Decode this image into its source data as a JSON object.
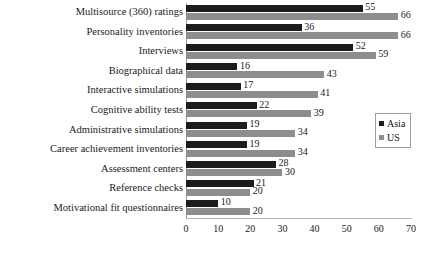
{
  "chart_data": {
    "type": "bar",
    "orientation": "horizontal",
    "title": "",
    "xlabel": "",
    "ylabel": "",
    "xlim": [
      0,
      70
    ],
    "xticks": [
      0,
      10,
      20,
      30,
      40,
      50,
      60,
      70
    ],
    "grid": false,
    "legend_position": "right",
    "categories": [
      "Multisource (360) ratings",
      "Personality inventories",
      "Interviews",
      "Biographical data",
      "Interactive simulations",
      "Cognitive ability tests",
      "Administrative simulations",
      "Career achievement inventories",
      "Assessment centers",
      "Reference checks",
      "Motivational fit questionnaires"
    ],
    "series": [
      {
        "name": "Asia",
        "color": "#1c1c1c",
        "values": [
          55,
          36,
          52,
          16,
          17,
          22,
          19,
          19,
          28,
          21,
          10
        ]
      },
      {
        "name": "US",
        "color": "#8d8d8d",
        "values": [
          66,
          66,
          59,
          43,
          41,
          39,
          34,
          34,
          30,
          20,
          20
        ]
      }
    ]
  }
}
